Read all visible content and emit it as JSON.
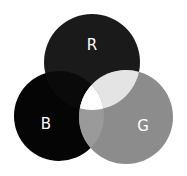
{
  "diagram": {
    "type": "venn",
    "title": "",
    "sets": [
      {
        "id": "R",
        "label": "R",
        "cx": 92,
        "cy": 62,
        "r": 48,
        "fill": "#1a1a1a"
      },
      {
        "id": "B",
        "label": "B",
        "cx": 59,
        "cy": 116,
        "r": 45,
        "fill": "#050505"
      },
      {
        "id": "G",
        "label": "G",
        "cx": 126,
        "cy": 117,
        "r": 47,
        "fill": "#8c8c8c"
      }
    ],
    "overlaps": {
      "R_B": "#0a0a0a",
      "R_G": "#e4e4e4",
      "B_G": "#9a9a9a",
      "R_B_G": "#ffffff"
    },
    "label_color": "#ffffff",
    "labels": {
      "R": {
        "text": "R",
        "x": 92,
        "y": 45
      },
      "B": {
        "text": "B",
        "x": 46,
        "y": 124
      },
      "G": {
        "text": "G",
        "x": 143,
        "y": 126
      }
    }
  }
}
